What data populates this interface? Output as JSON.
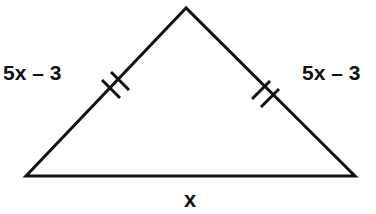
{
  "figure": {
    "type": "isosceles-triangle",
    "labels": {
      "left_side": "5x – 3",
      "right_side": "5x – 3",
      "base": "x"
    },
    "congruence_marks": {
      "left_side": "double-tick",
      "right_side": "double-tick"
    },
    "colors": {
      "stroke": "#111111",
      "background": "#ffffff"
    }
  }
}
